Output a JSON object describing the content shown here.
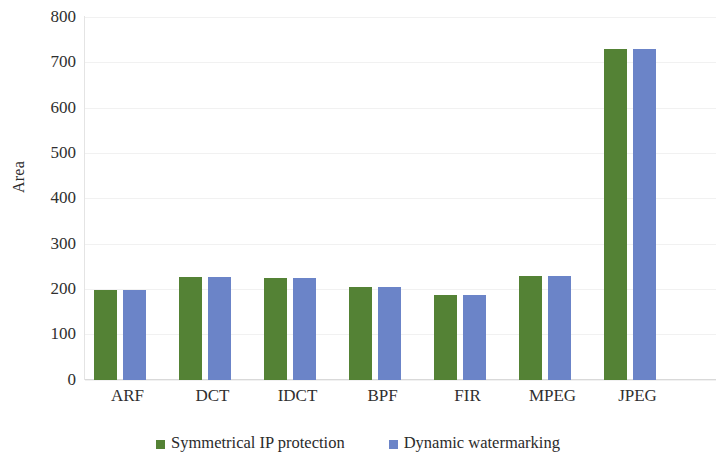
{
  "chart_data": {
    "type": "bar",
    "title": "",
    "xlabel": "",
    "ylabel": "Area",
    "ylim": [
      0,
      800
    ],
    "yticks": [
      0,
      100,
      200,
      300,
      400,
      500,
      600,
      700,
      800
    ],
    "ytick_labels": [
      "800",
      "700",
      "600",
      "500",
      "400",
      "300",
      "200",
      "100",
      "0"
    ],
    "grid": true,
    "legend_position": "bottom",
    "categories": [
      "ARF",
      "DCT",
      "IDCT",
      "BPF",
      "FIR",
      "MPEG",
      "JPEG"
    ],
    "series": [
      {
        "name": "Symmetrical IP protection",
        "color": "#548235",
        "values": [
          197,
          227,
          224,
          205,
          186,
          229,
          730
        ]
      },
      {
        "name": "Dynamic watermarking",
        "color": "#6B84C8",
        "values": [
          197,
          227,
          224,
          205,
          186,
          229,
          730
        ]
      }
    ]
  },
  "legend": {
    "items": [
      {
        "label": "Symmetrical IP protection",
        "color": "#548235"
      },
      {
        "label": "Dynamic watermarking",
        "color": "#6B84C8"
      }
    ]
  },
  "colors": {
    "series_green": "#548235",
    "series_blue": "#6B84C8",
    "gridline": "#F1F1F1",
    "axis": "#D9D9D9",
    "text": "#2B2B2B",
    "background": "#FFFFFF"
  }
}
